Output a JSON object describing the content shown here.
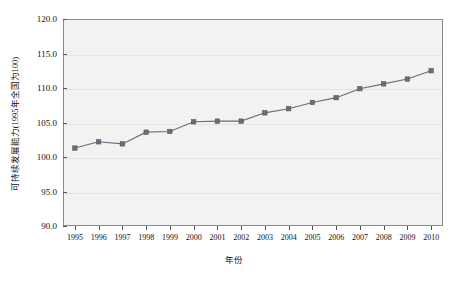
{
  "chart_data": {
    "type": "line",
    "title": "",
    "xlabel": "年份",
    "ylabel": "可持续发展能力(1995年全国为100)",
    "categories": [
      "1995",
      "1996",
      "1997",
      "1998",
      "1999",
      "2000",
      "2001",
      "2002",
      "2003",
      "2004",
      "2005",
      "2006",
      "2007",
      "2008",
      "2009",
      "2010"
    ],
    "values": [
      101.3,
      102.2,
      101.9,
      103.6,
      103.7,
      105.1,
      105.2,
      105.2,
      106.4,
      107.0,
      107.9,
      108.6,
      109.9,
      110.6,
      111.3,
      112.5
    ],
    "series": [
      {
        "name": "可持续发展能力",
        "values": [
          101.3,
          102.2,
          101.9,
          103.6,
          103.7,
          105.1,
          105.2,
          105.2,
          106.4,
          107.0,
          107.9,
          108.6,
          109.9,
          110.6,
          111.3,
          112.5
        ]
      }
    ],
    "ylim": [
      90.0,
      120.0
    ],
    "yticks": [
      "90.0",
      "95.0",
      "100.0",
      "105.0",
      "110.0",
      "115.0",
      "120.0"
    ],
    "ytick_values": [
      90.0,
      95.0,
      100.0,
      105.0,
      110.0,
      115.0,
      120.0
    ],
    "xticks": [
      "1995",
      "1996",
      "1997",
      "1998",
      "1999",
      "2000",
      "2001",
      "2002",
      "2003",
      "2004",
      "2005",
      "2006",
      "2007",
      "2008",
      "2009",
      "2010"
    ],
    "grid": true,
    "legend": false,
    "legend_position": "none",
    "line_color": "#6b6b7a",
    "marker_color": "#6b6b7a",
    "plot_background": "#f2f2f2",
    "axis_color": "#8a8a8a"
  }
}
